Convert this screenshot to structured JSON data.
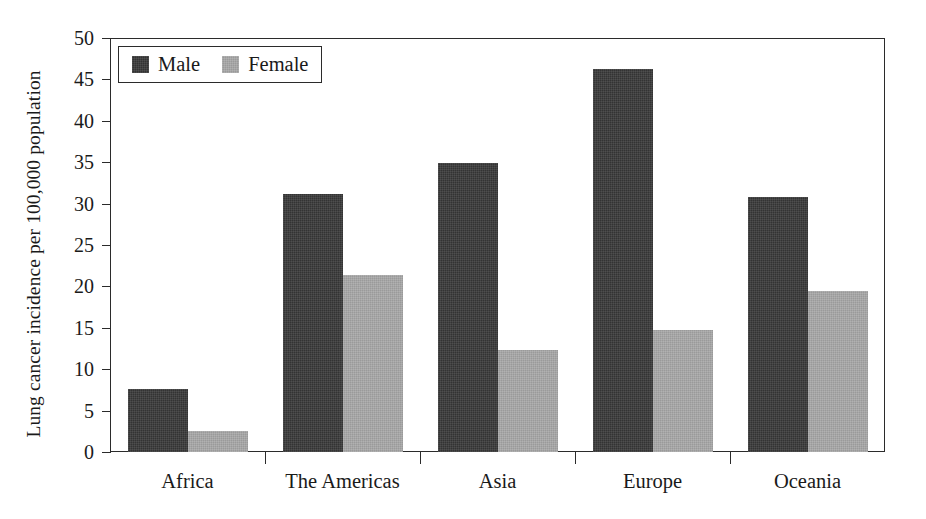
{
  "chart_data": {
    "type": "bar",
    "title": "",
    "xlabel": "",
    "ylabel": "Lung cancer incidence per 100,000 population",
    "categories": [
      "Africa",
      "The Americas",
      "Asia",
      "Europe",
      "Oceania"
    ],
    "series": [
      {
        "name": "Male",
        "color": "#333333",
        "values": [
          7.6,
          31.2,
          34.9,
          46.3,
          30.8
        ]
      },
      {
        "name": "Female",
        "color": "#9a9a9a",
        "values": [
          2.5,
          21.4,
          12.3,
          14.7,
          19.4
        ]
      }
    ],
    "ylim": [
      0,
      50
    ],
    "yticks": [
      0,
      5,
      10,
      15,
      20,
      25,
      30,
      35,
      40,
      45,
      50
    ],
    "ytick_labels": [
      "0",
      "5",
      "10",
      "15",
      "20",
      "25",
      "30",
      "35",
      "40",
      "45",
      "50"
    ],
    "grid": false,
    "legend_position": "top-left",
    "legend_entries": [
      "Male",
      "Female"
    ]
  },
  "legend": {
    "male_label": "Male",
    "female_label": "Female"
  },
  "axes": {
    "y_title": "Lung cancer incidence per 100,000 population"
  }
}
